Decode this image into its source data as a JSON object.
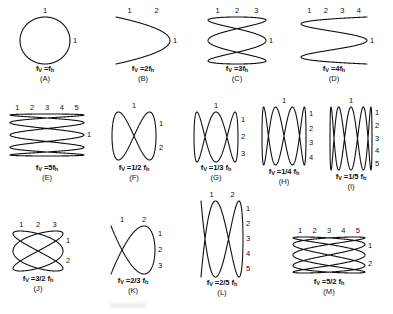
{
  "figure": {
    "background_color": "#ffffff",
    "stroke_color": "#111111",
    "stroke_width": 1.1,
    "panel_count": 13
  },
  "panels": [
    {
      "id": "A",
      "letter": "(A)",
      "formula_prefix": "f",
      "formula_sub1": "V",
      "formula_body": " =f",
      "formula_sub2": "h",
      "formula_text": "fV =fh",
      "ratio": "1:1",
      "fx": 1,
      "fy": 1,
      "phase_deg": 90,
      "top_ticks": [
        "1"
      ],
      "right_ticks": [
        "1"
      ],
      "box": {
        "x": 20,
        "y": 17,
        "w": 50,
        "h": 47
      },
      "caption_y": 64,
      "letter_y": 74
    },
    {
      "id": "B",
      "letter": "(B)",
      "formula_text": "fV =2fh",
      "ratio": "2:1",
      "fx": 2,
      "fy": 1,
      "phase_deg": 90,
      "top_ticks": [
        "1",
        "2"
      ],
      "right_ticks": [
        "1"
      ],
      "box": {
        "x": 116,
        "y": 17,
        "w": 54,
        "h": 47
      },
      "caption_y": 64,
      "letter_y": 74
    },
    {
      "id": "C",
      "letter": "(C)",
      "formula_text": "fV =3fh",
      "ratio": "3:1",
      "fx": 3,
      "fy": 1,
      "phase_deg": 90,
      "top_ticks": [
        "1",
        "2",
        "3"
      ],
      "right_ticks": [
        "1"
      ],
      "box": {
        "x": 208,
        "y": 17,
        "w": 58,
        "h": 47
      },
      "caption_y": 64,
      "letter_y": 74
    },
    {
      "id": "D",
      "letter": "(D)",
      "formula_text": "fV =4fh",
      "ratio": "4:1",
      "fx": 4,
      "fy": 1,
      "phase_deg": 90,
      "top_ticks": [
        "1",
        "2",
        "3",
        "4"
      ],
      "right_ticks": [
        "1"
      ],
      "box": {
        "x": 301,
        "y": 17,
        "w": 66,
        "h": 47
      },
      "caption_y": 64,
      "letter_y": 74
    },
    {
      "id": "E",
      "letter": "(E)",
      "formula_text": "fV =5fh",
      "ratio": "5:1",
      "fx": 5,
      "fy": 1,
      "phase_deg": 90,
      "top_ticks": [
        "1",
        "2",
        "3",
        "4",
        "5"
      ],
      "right_ticks": [
        "1"
      ],
      "box": {
        "x": 10,
        "y": 114,
        "w": 74,
        "h": 42
      },
      "caption_y": 163,
      "letter_y": 173
    },
    {
      "id": "F",
      "letter": "(F)",
      "formula_text": "fV =1/2 fh",
      "ratio": "1:2",
      "fx": 1,
      "fy": 2,
      "phase_deg": 90,
      "top_ticks": [
        "1"
      ],
      "right_ticks": [
        "1",
        "2"
      ],
      "box": {
        "x": 112,
        "y": 112,
        "w": 44,
        "h": 48
      },
      "caption_y": 163,
      "letter_y": 173
    },
    {
      "id": "G",
      "letter": "(G)",
      "formula_text": "fV =1/3 fh",
      "ratio": "1:3",
      "fx": 1,
      "fy": 3,
      "phase_deg": 90,
      "top_ticks": [
        "1"
      ],
      "right_ticks": [
        "1",
        "2",
        "3"
      ],
      "box": {
        "x": 194,
        "y": 112,
        "w": 44,
        "h": 50
      },
      "caption_y": 163,
      "letter_y": 173
    },
    {
      "id": "H",
      "letter": "(H)",
      "formula_text": "fV =1/4 fh",
      "ratio": "1:4",
      "fx": 1,
      "fy": 4,
      "phase_deg": 90,
      "top_ticks": [
        "1"
      ],
      "right_ticks": [
        "1",
        "2",
        "3",
        "4"
      ],
      "box": {
        "x": 262,
        "y": 107,
        "w": 44,
        "h": 58
      },
      "caption_y": 167,
      "letter_y": 177
    },
    {
      "id": "I",
      "letter": "(I)",
      "formula_text": "fV =1/5 fh",
      "ratio": "1:5",
      "fx": 1,
      "fy": 5,
      "phase_deg": 90,
      "top_ticks": [
        "1"
      ],
      "right_ticks": [
        "1",
        "2",
        "3",
        "4",
        "5"
      ],
      "box": {
        "x": 330,
        "y": 107,
        "w": 42,
        "h": 63
      },
      "caption_y": 172,
      "letter_y": 182
    },
    {
      "id": "J",
      "letter": "(J)",
      "formula_text": "fV =3/2 fh",
      "ratio": "3:2",
      "fx": 3,
      "fy": 2,
      "phase_deg": 90,
      "top_ticks": [
        "1",
        "2",
        "3"
      ],
      "right_ticks": [
        "1",
        "2"
      ],
      "box": {
        "x": 13,
        "y": 231,
        "w": 50,
        "h": 40
      },
      "caption_y": 274,
      "letter_y": 284
    },
    {
      "id": "K",
      "letter": "(K)",
      "formula_text": "fV =2/3 fh",
      "ratio": "2:3",
      "fx": 2,
      "fy": 3,
      "phase_deg": 90,
      "top_ticks": [
        "1",
        "2"
      ],
      "right_ticks": [
        "1",
        "2",
        "3"
      ],
      "box": {
        "x": 111,
        "y": 226,
        "w": 44,
        "h": 48
      },
      "caption_y": 276,
      "letter_y": 286
    },
    {
      "id": "L",
      "letter": "(L)",
      "formula_text": "fV =2/5 fh",
      "ratio": "2:5",
      "fx": 2,
      "fy": 5,
      "phase_deg": 90,
      "top_ticks": [
        "1",
        "2"
      ],
      "right_ticks": [
        "1",
        "2",
        "3",
        "4",
        "5"
      ],
      "box": {
        "x": 201,
        "y": 201,
        "w": 42,
        "h": 76
      },
      "caption_y": 278,
      "letter_y": 288
    },
    {
      "id": "M",
      "letter": "(M)",
      "formula_text": "fV =5/2 fh",
      "ratio": "5:2",
      "fx": 5,
      "fy": 2,
      "phase_deg": 90,
      "top_ticks": [
        "1",
        "2",
        "3",
        "4",
        "5"
      ],
      "right_ticks": [
        "1",
        "2"
      ],
      "box": {
        "x": 293,
        "y": 237,
        "w": 72,
        "h": 36
      },
      "caption_y": 277,
      "letter_y": 287
    }
  ]
}
